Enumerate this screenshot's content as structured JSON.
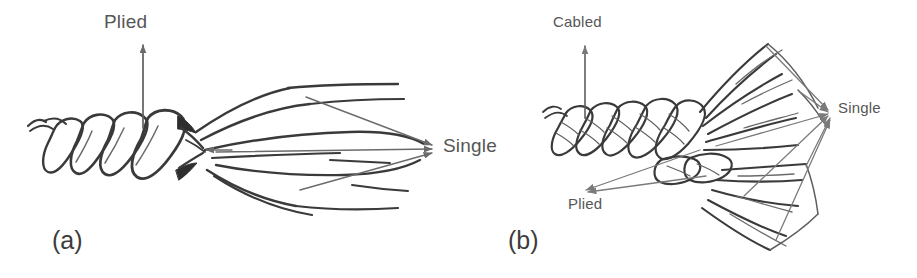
{
  "figure": {
    "background_color": "#ffffff",
    "ink_color": "#3a3a3a",
    "label_color": "#565656",
    "panel_label_color": "#3c3c3c",
    "arrow_color": "#6b6b6b",
    "panels": [
      {
        "id": "a",
        "panel_label": "(a)",
        "subject": "plied-yarn-untwisting-into-singles",
        "labels": [
          {
            "name": "plied-label-a",
            "text": "Plied",
            "arrow": "up"
          },
          {
            "name": "single-label-a",
            "text": "Single",
            "arrow": "right"
          }
        ]
      },
      {
        "id": "b",
        "panel_label": "(b)",
        "subject": "cabled-yarn-untwisting-into-plied-and-singles",
        "labels": [
          {
            "name": "cabled-label-b",
            "text": "Cabled",
            "arrow": "up"
          },
          {
            "name": "plied-label-b",
            "text": "Plied",
            "arrow": "down-left"
          },
          {
            "name": "single-label-b",
            "text": "Single",
            "arrow": "right"
          }
        ]
      }
    ]
  },
  "labels": {
    "plied_a": "Plied",
    "single_a": "Single",
    "panel_a": "(a)",
    "cabled_b": "Cabled",
    "plied_b": "Plied",
    "single_b": "Single",
    "panel_b": "(b)"
  }
}
